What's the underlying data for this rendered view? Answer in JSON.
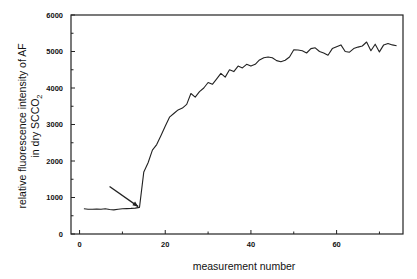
{
  "chart_data": {
    "type": "line",
    "title": "",
    "xlabel": "measurement number",
    "ylabel_line1": "relative fluorescence intensity of AF",
    "ylabel_line2_prefix": "in dry SCCO",
    "ylabel_line2_subscript": "2",
    "xlim": [
      -2,
      75.5
    ],
    "ylim": [
      0,
      6000
    ],
    "x_ticks_major": [
      0,
      20,
      40,
      60
    ],
    "x_ticks_minor": [
      10,
      30,
      50,
      70
    ],
    "y_ticks_major": [
      0,
      1000,
      2000,
      3000,
      4000,
      5000,
      6000
    ],
    "y_ticks_minor": [
      500,
      1500,
      2500,
      3500,
      4500,
      5500
    ],
    "grid": false,
    "legend": null,
    "annotations": [
      {
        "type": "arrow",
        "from": [
          7,
          1300
        ],
        "to": [
          13.7,
          750
        ],
        "label": ""
      }
    ],
    "series": [
      {
        "name": "relative fluorescence intensity of AF",
        "color": "#222222",
        "x": [
          1,
          2,
          3,
          4,
          5,
          6,
          7,
          8,
          9,
          10,
          11,
          12,
          13,
          14,
          15,
          16,
          17,
          18,
          19,
          20,
          21,
          22,
          23,
          24,
          25,
          26,
          27,
          28,
          29,
          30,
          31,
          32,
          33,
          34,
          35,
          36,
          37,
          38,
          39,
          40,
          41,
          42,
          43,
          44,
          45,
          46,
          47,
          48,
          49,
          50,
          51,
          52,
          53,
          54,
          55,
          56,
          57,
          58,
          59,
          60,
          61,
          62,
          63,
          64,
          65,
          66,
          67,
          68,
          69,
          70,
          71,
          72,
          73,
          74
        ],
        "y": [
          690,
          680,
          680,
          685,
          680,
          690,
          670,
          660,
          680,
          690,
          695,
          700,
          710,
          730,
          1700,
          1950,
          2300,
          2450,
          2700,
          2950,
          3200,
          3300,
          3400,
          3450,
          3550,
          3850,
          3750,
          3900,
          4000,
          4150,
          4100,
          4250,
          4400,
          4300,
          4500,
          4450,
          4600,
          4550,
          4650,
          4600,
          4650,
          4770,
          4830,
          4850,
          4830,
          4750,
          4720,
          4760,
          4850,
          5050,
          5040,
          5020,
          4960,
          5080,
          5100,
          5000,
          4960,
          4900,
          5080,
          5130,
          5180,
          5000,
          4980,
          5080,
          5120,
          5150,
          5260,
          5020,
          5200,
          4990,
          5180,
          5220,
          5180,
          5160
        ]
      }
    ]
  }
}
